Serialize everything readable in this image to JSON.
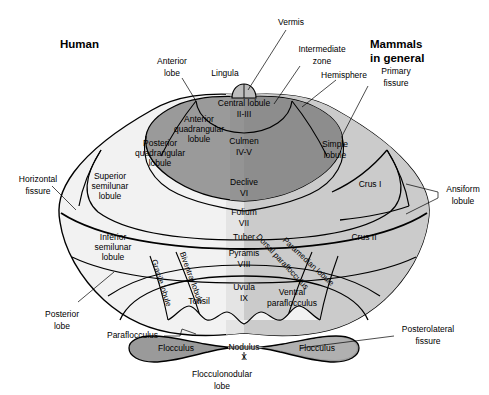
{
  "figure": {
    "title_left": "Human",
    "title_right_line1": "Mammals",
    "title_right_line2": "in general"
  },
  "colors": {
    "anterior_lobe_fill": "#9a9a9a",
    "anterior_lobe_fill_right": "#8d8d8d",
    "posterior_lobe_fill": "#f2f2f2",
    "posterior_lobe_fill_right": "#cfcfcf",
    "flocculonodular_fill": "#9a9a9a",
    "flocculonodular_fill_right": "#b5b5b5",
    "lingula_fill": "#bdbdbd",
    "outline": "#000000",
    "background": "#ffffff"
  },
  "callouts_left": [
    {
      "id": "anterior-lobe",
      "lines": [
        "Anterior",
        "lobe"
      ]
    },
    {
      "id": "lingula",
      "lines": [
        "Lingula"
      ]
    },
    {
      "id": "horizontal-fissure",
      "lines": [
        "Horizontal",
        "fissure"
      ]
    },
    {
      "id": "posterior-lobe",
      "lines": [
        "Posterior",
        "lobe"
      ]
    },
    {
      "id": "parafloccuclus",
      "lines": [
        "Paraflocculus"
      ]
    },
    {
      "id": "flocculonodular-lobe",
      "lines": [
        "Flocculonodular",
        "lobe"
      ]
    }
  ],
  "callouts_right": [
    {
      "id": "vermis",
      "lines": [
        "Vermis"
      ]
    },
    {
      "id": "intermediate-zone",
      "lines": [
        "Intermediate",
        "zone"
      ]
    },
    {
      "id": "hemisphere",
      "lines": [
        "Hemisphere"
      ]
    },
    {
      "id": "primary-fissure",
      "lines": [
        "Primary",
        "fissure"
      ]
    },
    {
      "id": "ansiform-lobule",
      "lines": [
        "Ansiform",
        "lobule"
      ]
    },
    {
      "id": "posterolateral-fissure",
      "lines": [
        "Posterolateral",
        "fissure"
      ]
    }
  ],
  "regions_human": [
    {
      "id": "anterior-quadrangular-lobule",
      "lines": [
        "Anterior",
        "quadrangular",
        "lobule"
      ]
    },
    {
      "id": "posterior-quadrangular-lobule",
      "lines": [
        "Posterior",
        "quadrangular",
        "lobule"
      ]
    },
    {
      "id": "superior-semilunar-lobule",
      "lines": [
        "Superior",
        "semilunar",
        "lobule"
      ]
    },
    {
      "id": "inferior-semilunar-lobule",
      "lines": [
        "Inferior",
        "semilunar",
        "lobule"
      ]
    },
    {
      "id": "gracile-lobule",
      "lines": [
        "Gracile lobule"
      ]
    },
    {
      "id": "biventral-lobule",
      "lines": [
        "Biventral lobule"
      ]
    },
    {
      "id": "tonsil",
      "lines": [
        "Tonsil"
      ]
    },
    {
      "id": "flocculus-left",
      "lines": [
        "Flocculus"
      ]
    }
  ],
  "regions_vermis": [
    {
      "id": "central-lobule",
      "lines": [
        "Central lobule",
        "II-III"
      ]
    },
    {
      "id": "culmen",
      "lines": [
        "Culmen",
        "IV-V"
      ]
    },
    {
      "id": "declive",
      "lines": [
        "Declive",
        "VI"
      ]
    },
    {
      "id": "folium",
      "lines": [
        "Folium",
        "VII"
      ]
    },
    {
      "id": "tuber",
      "lines": [
        "Tuber"
      ]
    },
    {
      "id": "pyramis",
      "lines": [
        "Pyramis",
        "VIII"
      ]
    },
    {
      "id": "uvula",
      "lines": [
        "Uvula",
        "IX"
      ]
    },
    {
      "id": "nodulus",
      "lines": [
        "Nodulus",
        "X"
      ]
    }
  ],
  "regions_mammal": [
    {
      "id": "simple-lobule",
      "lines": [
        "Simple",
        "lobule"
      ]
    },
    {
      "id": "crus-i",
      "lines": [
        "Crus I"
      ]
    },
    {
      "id": "crus-ii",
      "lines": [
        "Crus II"
      ]
    },
    {
      "id": "paramedian-lobule",
      "lines": [
        "Paramedian lobule"
      ]
    },
    {
      "id": "dorsal-paraflocculus",
      "lines": [
        "Dorsal paraflocculus"
      ]
    },
    {
      "id": "ventral-paraflocculus",
      "lines": [
        "Ventral",
        "paraflocculus"
      ]
    },
    {
      "id": "flocculus-right",
      "lines": [
        "Flocculus"
      ]
    }
  ]
}
